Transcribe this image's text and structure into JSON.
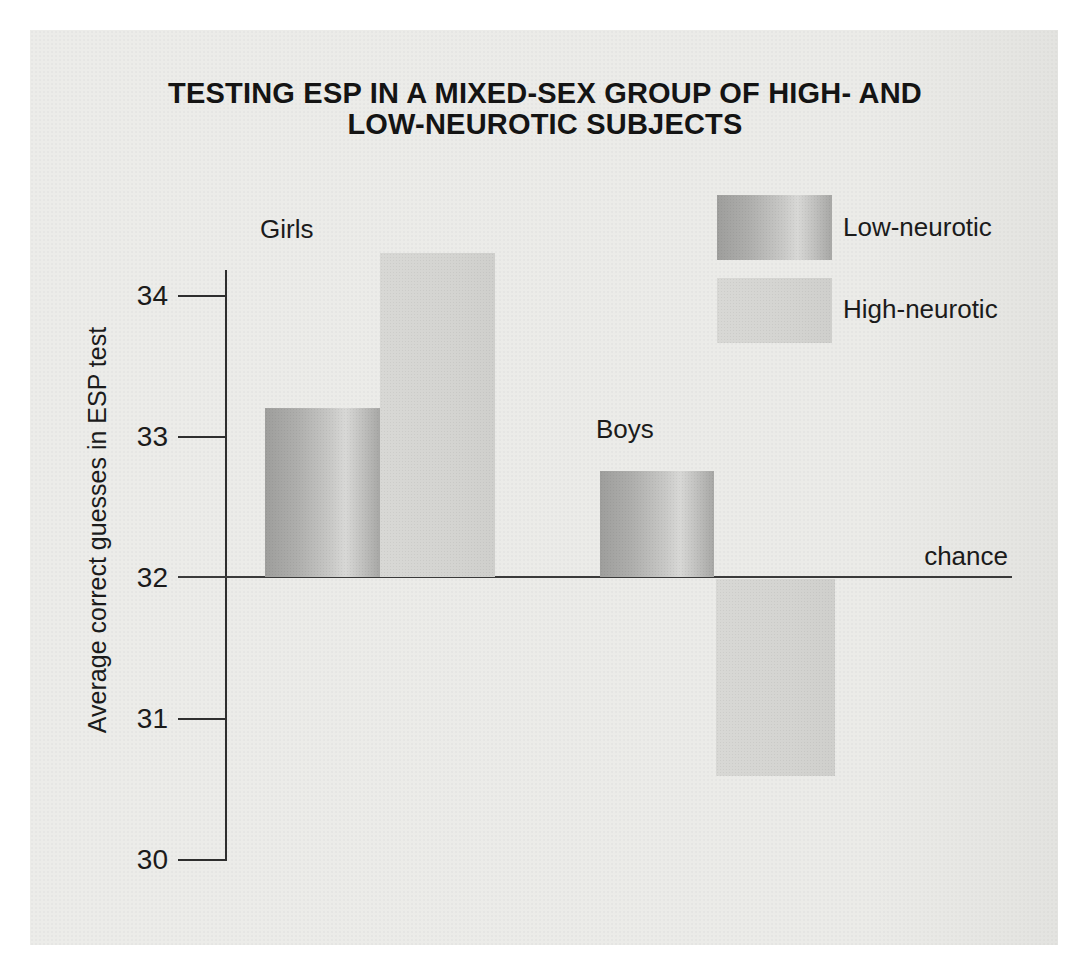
{
  "title": {
    "line1": "TESTING ESP IN A MIXED-SEX GROUP OF HIGH- AND",
    "line2": "LOW-NEUROTIC SUBJECTS"
  },
  "y_axis": {
    "label": "Average correct guesses in ESP test",
    "ticks": [
      "34",
      "33",
      "32",
      "31",
      "30"
    ]
  },
  "annotations": {
    "chance_label": "chance"
  },
  "groups": {
    "girls_label": "Girls",
    "boys_label": "Boys"
  },
  "legend": {
    "low_label": "Low-neurotic",
    "high_label": "High-neurotic"
  },
  "colors": {
    "panel_background": "#ebebe8",
    "low_neurotic_dark": "#9e9e9c",
    "low_neurotic_highlight": "#d8d8d6",
    "high_neurotic": "#d5d5d2",
    "line": "#2e2e2e",
    "text": "#1b1b1b"
  },
  "chart_data": {
    "type": "bar",
    "title": "TESTING ESP IN A MIXED-SEX GROUP OF HIGH- AND LOW-NEUROTIC SUBJECTS",
    "xlabel": "",
    "ylabel": "Average correct guesses in ESP test",
    "categories": [
      "Girls",
      "Boys"
    ],
    "series": [
      {
        "name": "Low-neurotic",
        "values": [
          33.2,
          32.75
        ]
      },
      {
        "name": "High-neurotic",
        "values": [
          34.3,
          30.6
        ]
      }
    ],
    "yticks": [
      30,
      31,
      32,
      33,
      34
    ],
    "ylim": [
      30,
      34.5
    ],
    "baseline": 32,
    "baseline_label": "chance",
    "legend_position": "top-right",
    "grid": false
  }
}
